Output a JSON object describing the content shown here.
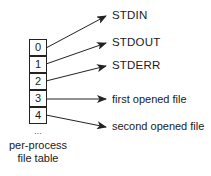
{
  "diagram": {
    "table": {
      "cells": [
        "0",
        "1",
        "2",
        "3",
        "4"
      ],
      "continuation": "...",
      "caption_line1": "per-process",
      "caption_line2": "file table"
    },
    "targets": [
      {
        "label": "STDIN",
        "from_cell": "0"
      },
      {
        "label": "STDOUT",
        "from_cell": "1"
      },
      {
        "label": "STDERR",
        "from_cell": "2"
      },
      {
        "label": "first opened file",
        "from_cell": "3"
      },
      {
        "label": "second opened file",
        "from_cell": "4"
      }
    ],
    "colors": {
      "stroke": "#222222",
      "background": "#ffffff",
      "text": "#1a1a1a"
    }
  }
}
